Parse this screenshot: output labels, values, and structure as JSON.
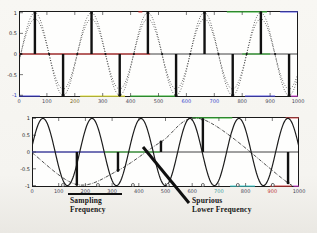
{
  "figure": {
    "background": "#f5f4f0",
    "plot_background": "#fefefd",
    "axis_color": "#1a1a1a"
  },
  "annotations": {
    "sampling_frequency": {
      "line1": "Sampling",
      "line2": "Frequency"
    },
    "spurious": {
      "line1": "Spurious",
      "line2": "Lower Frequency"
    }
  },
  "chart_data": [
    {
      "type": "line",
      "name": "adequately-sampled-signal",
      "title": "",
      "xlabel": "",
      "ylabel": "",
      "xlim": [
        0,
        1000
      ],
      "ylim": [
        -1,
        1
      ],
      "grid": false,
      "x_ticks": [
        "0",
        "100",
        "200",
        "300",
        "400",
        "500",
        "600",
        "700",
        "800",
        "900",
        "1000"
      ],
      "x_tick_colors": [
        "#445",
        "#445",
        "#776622",
        "#445",
        "#445",
        "#445",
        "#3344cc",
        "#3344cc",
        "#445",
        "#445",
        "#445"
      ],
      "y_ticks": [
        "1",
        "0.5",
        "0",
        "-0.5",
        "-1"
      ],
      "y_tick_values": [
        1,
        0.5,
        0,
        -0.5,
        -1
      ],
      "y_tick_colors": [
        "#222",
        "#222",
        "#222",
        "#222",
        "#2233bb"
      ],
      "signal": {
        "kind": "cosine",
        "amplitude": 1.0,
        "peak_at": 57,
        "period": 202.4,
        "style": "dotted",
        "color": "#1c1c1c"
      },
      "signal_inner": {
        "kind": "cosine",
        "amplitude": 0.85,
        "peak_at": 57,
        "period": 202.4,
        "style": "dotted",
        "color": "#1c1c1c"
      },
      "stems_up": [
        57,
        260,
        462,
        665,
        867
      ],
      "stems_down": [
        158,
        361,
        563,
        766,
        968
      ],
      "stem_value": 1.0,
      "zero_dots": [
        7,
        108,
        209,
        310,
        412,
        513,
        614,
        715,
        816,
        918
      ],
      "decor": [
        {
          "line": "zero",
          "color": "#cc2222",
          "from": 0,
          "to": 470
        },
        {
          "line": "zero",
          "color": "#2faa2f",
          "from": 800,
          "to": 900
        },
        {
          "line": "bottom",
          "color": "#3a3acc",
          "from": 0,
          "to": 75
        },
        {
          "line": "bottom",
          "color": "#e0e040",
          "from": 219,
          "to": 380
        },
        {
          "line": "bottom",
          "color": "#35ad35",
          "from": 398,
          "to": 559
        },
        {
          "line": "bottom",
          "color": "#4747dd",
          "from": 810,
          "to": 918
        },
        {
          "line": "bottom",
          "color": "#cc38cc",
          "from": 975,
          "to": 1000
        },
        {
          "line": "top",
          "color": "#35ad35",
          "from": 745,
          "to": 889
        },
        {
          "line": "top",
          "color": "#4747dd",
          "from": 936,
          "to": 1000
        },
        {
          "line": "top",
          "color": "#cc2222",
          "from": 428,
          "to": 442
        }
      ]
    },
    {
      "type": "line",
      "name": "undersampled-aliased-signal",
      "title": "",
      "xlabel": "",
      "ylabel": "",
      "xlim": [
        0,
        1000
      ],
      "ylim": [
        -1,
        1
      ],
      "grid": false,
      "x_ticks": [
        "0",
        "100",
        "200",
        "300",
        "400",
        "500",
        "600",
        "700",
        "800",
        "900",
        "1000"
      ],
      "x_tick_colors": [
        "#445",
        "#445",
        "#445",
        "#445",
        "#445",
        "#445",
        "#445",
        "#3a9b9b",
        "#445",
        "#b33",
        "#445"
      ],
      "y_ticks": [
        "1",
        "0.5",
        "0",
        "-0.5",
        "-1"
      ],
      "y_tick_values": [
        1,
        0.5,
        0,
        -0.5,
        -1
      ],
      "y_tick_colors": [
        "#222",
        "#222",
        "#222",
        "#222",
        "#222"
      ],
      "signal": {
        "kind": "cosine",
        "amplitude": 1.0,
        "peak_at": 41,
        "period": 183.5,
        "style": "solid",
        "color": "#1c1c1c"
      },
      "stems": [
        {
          "x": 168,
          "y": -0.97
        },
        {
          "x": 322,
          "y": -0.55
        },
        {
          "x": 483,
          "y": 0.3
        },
        {
          "x": 640,
          "y": 0.97
        },
        {
          "x": 959,
          "y": -0.92
        }
      ],
      "alias_path": [
        {
          "x": 0,
          "y": -0.02
        },
        {
          "x": 168,
          "y": -0.97
        },
        {
          "x": 322,
          "y": -0.55
        },
        {
          "x": 483,
          "y": 0.3
        },
        {
          "x": 640,
          "y": 0.97
        },
        {
          "x": 959,
          "y": -0.92
        },
        {
          "x": 1000,
          "y": -1.0
        }
      ],
      "axis_markers": [
        116,
        247,
        378,
        509,
        640,
        771,
        902
      ],
      "decor": [
        {
          "line": "zero",
          "color": "#4646cc",
          "from": 0,
          "to": 273
        },
        {
          "line": "zero",
          "color": "#35ad35",
          "from": 273,
          "to": 479
        },
        {
          "line": "top",
          "color": "#35ad35",
          "from": 600,
          "to": 750
        },
        {
          "line": "top",
          "color": "#cc4444",
          "from": 950,
          "to": 1000
        },
        {
          "line": "bottom",
          "color": "#3ac9c9",
          "from": 742,
          "to": 835
        },
        {
          "line": "bottom",
          "color": "#cc3333",
          "from": 891,
          "to": 973
        },
        {
          "line": "bottom",
          "color": "#cc38cc",
          "from": 978,
          "to": 1000
        }
      ]
    }
  ]
}
